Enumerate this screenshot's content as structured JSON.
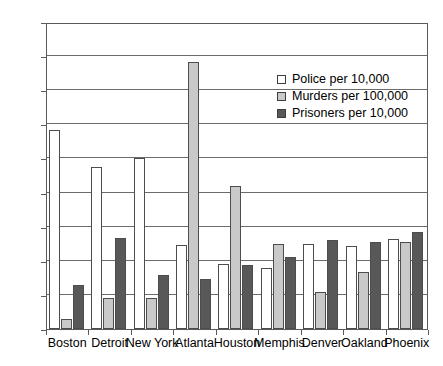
{
  "chart_data": {
    "type": "bar",
    "title": "",
    "subtitle": "",
    "xlabel": "",
    "ylabel": "",
    "ylim": [
      0,
      45
    ],
    "yticks": [
      0,
      5,
      10,
      15,
      20,
      25,
      30,
      35,
      40,
      45
    ],
    "ytick_labels": [
      "0",
      "5",
      "10",
      "15",
      "20",
      "25",
      "30",
      "35",
      "40",
      "45"
    ],
    "grid": true,
    "grid_axis": "y",
    "legend_position": "upper right inside",
    "categories": [
      "Boston",
      "Detroit",
      "New York",
      "Atlanta",
      "Houston",
      "Memphis",
      "Denver",
      "Oakland",
      "Phoenix"
    ],
    "series": [
      {
        "name": "Police per 10,000",
        "color": "#ffffff",
        "values": [
          29.2,
          23.7,
          25.1,
          12.3,
          9.6,
          8.9,
          12.4,
          12.1,
          13.2
        ]
      },
      {
        "name": "Murders per 100,000",
        "color": "#c9c9c9",
        "values": [
          1.5,
          4.6,
          4.5,
          39.2,
          21.0,
          12.5,
          5.4,
          8.4,
          12.8
        ]
      },
      {
        "name": "Prisoners per 10,000",
        "color": "#585858",
        "values": [
          6.5,
          13.4,
          7.9,
          7.4,
          9.4,
          10.5,
          13.0,
          12.8,
          14.2
        ]
      }
    ]
  },
  "legend": {
    "items": [
      {
        "label": "Police per 10,000",
        "swatch": "police"
      },
      {
        "label": "Murders per 100,000",
        "swatch": "murders"
      },
      {
        "label": "Prisoners per 10,000",
        "swatch": "prisoners"
      }
    ]
  },
  "colors": {
    "police": "#ffffff",
    "murders": "#c9c9c9",
    "prisoners": "#585858",
    "axis": "#5a5a5a",
    "grid": "#6b6b6b",
    "text": "#000000",
    "background": "#ffffff"
  }
}
